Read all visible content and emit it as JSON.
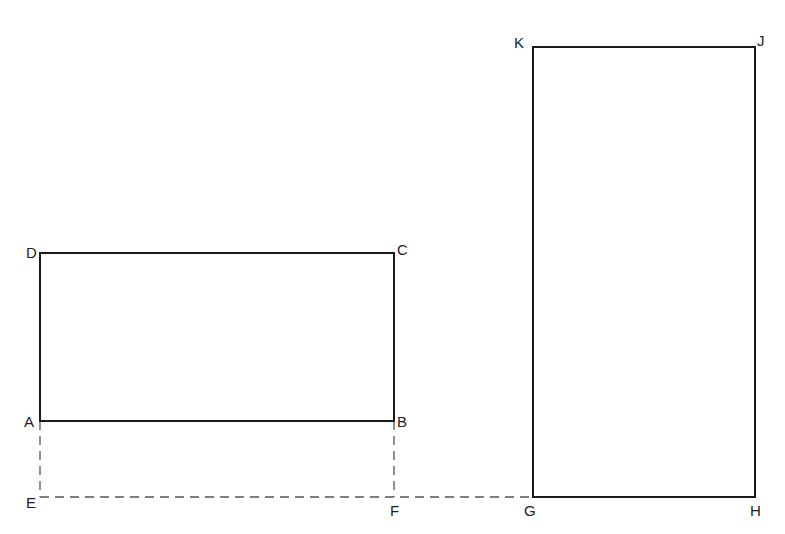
{
  "diagram": {
    "colors": {
      "line": "#1a1a1a",
      "dashed": "#555555",
      "label": "#222222",
      "background": "#ffffff"
    },
    "points": {
      "A": {
        "label": "A",
        "x": 40,
        "y": 421
      },
      "B": {
        "label": "B",
        "x": 394,
        "y": 421
      },
      "C": {
        "label": "C",
        "x": 394,
        "y": 253
      },
      "D": {
        "label": "D",
        "x": 40,
        "y": 253
      },
      "E": {
        "label": "E",
        "x": 40,
        "y": 497
      },
      "F": {
        "label": "F",
        "x": 394,
        "y": 497
      },
      "G": {
        "label": "G",
        "x": 533,
        "y": 497
      },
      "H": {
        "label": "H",
        "x": 755,
        "y": 497
      },
      "J": {
        "label": "J",
        "x": 755,
        "y": 47
      },
      "K": {
        "label": "K",
        "x": 533,
        "y": 47
      }
    },
    "shapes": [
      {
        "name": "rectangle-ABCD",
        "style": "solid",
        "vertices": [
          "A",
          "B",
          "C",
          "D"
        ]
      },
      {
        "name": "rectangle-GHJK",
        "style": "solid",
        "vertices": [
          "G",
          "H",
          "J",
          "K"
        ]
      }
    ],
    "dashed_lines": [
      {
        "name": "line-AE",
        "from": "A",
        "to": "E"
      },
      {
        "name": "line-BF",
        "from": "B",
        "to": "F"
      },
      {
        "name": "line-EG",
        "from": "E",
        "to": "G"
      }
    ]
  }
}
